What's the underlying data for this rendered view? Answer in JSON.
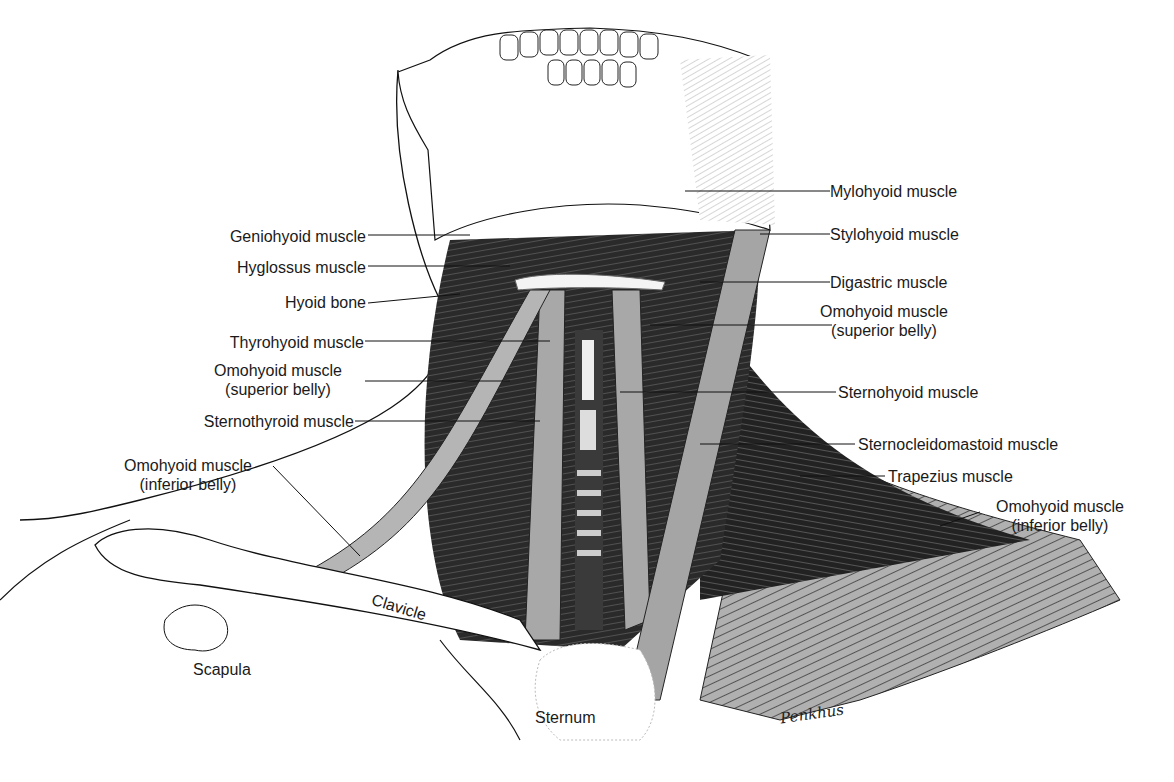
{
  "figure": {
    "colors": {
      "ink": "#111111",
      "muscle_dark": "#1c1c1c",
      "muscle_mid": "#5a5a5a",
      "muscle_light": "#a8a8a8",
      "bone": "#ffffff",
      "background": "#ffffff"
    }
  },
  "labels_left": [
    {
      "id": "geniohyoid",
      "text": "Geniohyoid muscle"
    },
    {
      "id": "hyoglossus",
      "text": "Hyglossus muscle"
    },
    {
      "id": "hyoid-bone",
      "text": "Hyoid bone"
    },
    {
      "id": "thyrohyoid",
      "text": "Thyrohyoid muscle"
    },
    {
      "id": "omohyoid-superior-left",
      "text": "Omohyoid muscle",
      "text2": "(superior belly)"
    },
    {
      "id": "sternothyroid",
      "text": "Sternothyroid muscle"
    },
    {
      "id": "omohyoid-inferior-left",
      "text": "Omohyoid muscle",
      "text2": "(inferior belly)"
    }
  ],
  "labels_right": [
    {
      "id": "mylohyoid",
      "text": "Mylohyoid muscle"
    },
    {
      "id": "stylohyoid",
      "text": "Stylohyoid muscle"
    },
    {
      "id": "digastric",
      "text": "Digastric muscle"
    },
    {
      "id": "omohyoid-superior-right",
      "text": "Omohyoid muscle",
      "text2": "(superior belly)"
    },
    {
      "id": "sternohyoid",
      "text": "Sternohyoid muscle"
    },
    {
      "id": "sternocleidomastoid",
      "text": "Sternocleidomastoid muscle"
    },
    {
      "id": "trapezius",
      "text": "Trapezius muscle"
    },
    {
      "id": "omohyoid-inferior-right",
      "text": "Omohyoid muscle",
      "text2": "(inferior belly)"
    }
  ],
  "labels_bone": [
    {
      "id": "clavicle",
      "text": "Clavicle"
    },
    {
      "id": "scapula",
      "text": "Scapula"
    },
    {
      "id": "sternum",
      "text": "Sternum"
    }
  ],
  "signature": "Penkhus"
}
